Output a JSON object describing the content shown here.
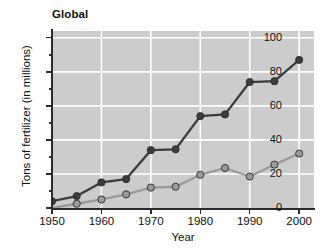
{
  "chart_data": {
    "type": "line",
    "title": "Global",
    "xlabel": "Year",
    "ylabel": "Tons of fertilizer (in millions)",
    "x": [
      1950,
      1955,
      1960,
      1965,
      1970,
      1975,
      1980,
      1985,
      1990,
      1995,
      2000
    ],
    "xlim": [
      1950,
      2003
    ],
    "ylim": [
      0,
      104
    ],
    "xticks": [
      1950,
      1960,
      1970,
      1980,
      1990,
      2000
    ],
    "xtick_labels": [
      "1950",
      "1960",
      "1970",
      "1980",
      "1990",
      "2000"
    ],
    "yticks": [
      0,
      20,
      40,
      60,
      80,
      100
    ],
    "ytick_labels": [
      "0",
      "20",
      "40",
      "60",
      "80",
      "100"
    ],
    "yticks_minor": [
      10,
      30,
      50,
      70,
      90
    ],
    "grid": true,
    "grid_color": "#ffffff",
    "plot_background": "#cccccc",
    "legend": "none",
    "series": [
      {
        "name": "dark-series",
        "color": "#3c3c3c",
        "marker_fill": "#3c3c3c",
        "values": [
          4,
          7,
          15,
          17,
          34,
          34.5,
          54,
          55,
          74,
          74.5,
          87
        ]
      },
      {
        "name": "light-series",
        "color": "#9a9a9a",
        "marker_fill": "#9a9a9a",
        "values": [
          0,
          2.5,
          5,
          8,
          12,
          12.5,
          19.5,
          23.5,
          18.5,
          25.5,
          32
        ]
      }
    ]
  }
}
